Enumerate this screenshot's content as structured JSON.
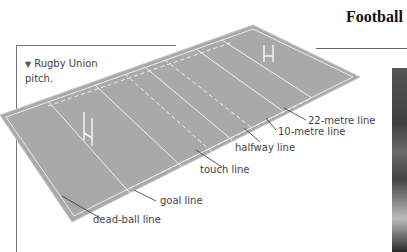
{
  "header": {
    "title": "Football"
  },
  "caption": {
    "marker": "▼",
    "text_line1": "Rugby Union",
    "text_line2": "pitch."
  },
  "diagram": {
    "subject": "Rugby Union pitch",
    "pitch_color": "#a9a9a9",
    "line_color": "#f2f2f2",
    "labels": [
      {
        "id": "22-metre",
        "text": "22-metre line"
      },
      {
        "id": "10-metre",
        "text": "10-metre line"
      },
      {
        "id": "halfway",
        "text": "halfway line"
      },
      {
        "id": "touch",
        "text": "touch line"
      },
      {
        "id": "goal",
        "text": "goal line"
      },
      {
        "id": "dead-ball",
        "text": "dead-ball line"
      }
    ]
  },
  "photo": {
    "description": "dark photo edge"
  }
}
